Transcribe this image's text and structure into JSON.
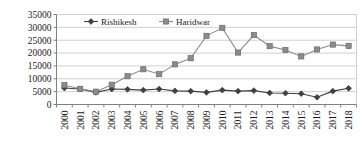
{
  "chart_data": {
    "type": "line",
    "title": "",
    "subtitle": "",
    "xlabel": "",
    "ylabel": "",
    "categories": [
      "2000",
      "2001",
      "2002",
      "2003",
      "2004",
      "2005",
      "2006",
      "2007",
      "2008",
      "2009",
      "2010",
      "2011",
      "2012",
      "2013",
      "2014",
      "2015",
      "2016",
      "2017",
      "2018"
    ],
    "series": [
      {
        "name": "Rishikesh",
        "marker": "diamond",
        "color": "#404040",
        "values": [
          6400,
          6000,
          4700,
          6000,
          5900,
          5600,
          6000,
          5300,
          5200,
          4700,
          5600,
          5200,
          5400,
          4500,
          4400,
          4200,
          2800,
          5200,
          6300
        ]
      },
      {
        "name": "Haridwar",
        "marker": "square",
        "color": "#8c8c8c",
        "values": [
          7500,
          6100,
          5000,
          7700,
          11000,
          13700,
          11800,
          15600,
          18000,
          26700,
          29800,
          20200,
          27000,
          22700,
          21200,
          18700,
          21400,
          23300,
          22800
        ]
      }
    ],
    "ylim": [
      0,
      35000
    ],
    "ytick_values": [
      0,
      5000,
      10000,
      15000,
      20000,
      25000,
      30000,
      35000
    ],
    "ytick_labels": [
      "0",
      "5000",
      "10000",
      "15000",
      "20000",
      "25000",
      "30000",
      "35000"
    ],
    "grid": true,
    "grid_axis": "y",
    "legend_position": "top-center",
    "legend_entries": [
      "Rishikesh",
      "Haridwar"
    ],
    "xtick_rotation": -90,
    "axis_color": "#808080",
    "grid_color": "#d0d0d0",
    "background": "#ffffff"
  }
}
